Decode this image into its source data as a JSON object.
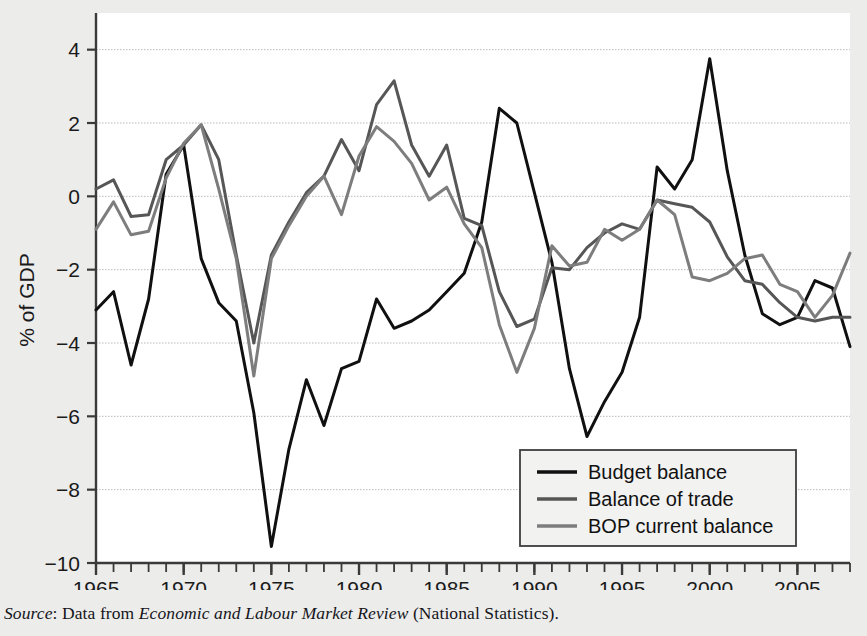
{
  "source_note": {
    "label": "Source",
    "sep": ": ",
    "lead": "Data from ",
    "publication": "Economic and Labour Market Review",
    "trail": " (National Statistics)."
  },
  "legend": {
    "position": "bottom-right",
    "entries": [
      {
        "label": "Budget balance",
        "color": "#101010"
      },
      {
        "label": "Balance of trade",
        "color": "#565656"
      },
      {
        "label": "BOP current balance",
        "color": "#7d7d7d"
      }
    ]
  },
  "chart_data": {
    "type": "line",
    "title": "",
    "xlabel": "",
    "ylabel": "% of GDP",
    "xlim": [
      1965,
      2008
    ],
    "ylim": [
      -10,
      5
    ],
    "grid": true,
    "y_ticks": [
      4,
      2,
      0,
      -2,
      -4,
      -6,
      -8,
      -10
    ],
    "y_tick_labels": [
      "4",
      "2",
      "0",
      "−2",
      "−4",
      "−6",
      "−8",
      "−10"
    ],
    "x_ticks_major": [
      1965,
      1970,
      1975,
      1980,
      1985,
      1990,
      1995,
      2000,
      2005
    ],
    "x_tick_labels": [
      "1965",
      "1970",
      "1975",
      "1980",
      "1985",
      "1990",
      "1995",
      "2000",
      "2005"
    ],
    "x_tick_minor_step": 1,
    "x": [
      1965,
      1966,
      1967,
      1968,
      1969,
      1970,
      1971,
      1972,
      1973,
      1974,
      1975,
      1976,
      1977,
      1978,
      1979,
      1980,
      1981,
      1982,
      1983,
      1984,
      1985,
      1986,
      1987,
      1988,
      1989,
      1990,
      1991,
      1992,
      1993,
      1994,
      1995,
      1996,
      1997,
      1998,
      1999,
      2000,
      2001,
      2002,
      2003,
      2004,
      2005,
      2006,
      2007,
      2008
    ],
    "series": [
      {
        "name": "Budget balance",
        "color": "#101010",
        "values": [
          -3.1,
          -2.6,
          -4.6,
          -2.8,
          0.6,
          1.4,
          -1.7,
          -2.9,
          -3.4,
          -5.9,
          -9.55,
          -6.9,
          -5.0,
          -6.25,
          -4.7,
          -4.5,
          -2.8,
          -3.6,
          -3.4,
          -3.1,
          -2.6,
          -2.1,
          -0.7,
          2.4,
          2.0,
          0.1,
          -1.8,
          -4.7,
          -6.55,
          -5.6,
          -4.8,
          -3.3,
          0.8,
          0.2,
          1.0,
          3.75,
          0.7,
          -1.6,
          -3.2,
          -3.5,
          -3.3,
          -2.3,
          -2.5,
          -4.1
        ]
      },
      {
        "name": "Balance of trade",
        "color": "#565656",
        "values": [
          0.2,
          0.45,
          -0.55,
          -0.5,
          1.0,
          1.4,
          1.95,
          1.0,
          -1.6,
          -4.0,
          -1.6,
          -0.7,
          0.1,
          0.55,
          1.55,
          0.7,
          2.5,
          3.15,
          1.4,
          0.55,
          1.4,
          -0.6,
          -0.8,
          -2.6,
          -3.55,
          -3.35,
          -1.95,
          -2.0,
          -1.4,
          -1.0,
          -0.75,
          -0.9,
          -0.1,
          -0.2,
          -0.3,
          -0.7,
          -1.65,
          -2.3,
          -2.4,
          -2.9,
          -3.3,
          -3.4,
          -3.3,
          -3.3
        ]
      },
      {
        "name": "BOP current balance",
        "color": "#7d7d7d",
        "values": [
          -0.9,
          -0.15,
          -1.05,
          -0.95,
          0.5,
          1.45,
          1.95,
          0.2,
          -1.7,
          -4.9,
          -1.7,
          -0.8,
          0.0,
          0.55,
          -0.5,
          1.1,
          1.9,
          1.5,
          0.9,
          -0.1,
          0.25,
          -0.75,
          -1.4,
          -3.5,
          -4.8,
          -3.6,
          -1.35,
          -1.9,
          -1.8,
          -0.9,
          -1.2,
          -0.9,
          -0.1,
          -0.5,
          -2.2,
          -2.3,
          -2.1,
          -1.7,
          -1.6,
          -2.4,
          -2.6,
          -3.3,
          -2.7,
          -1.55
        ]
      }
    ]
  }
}
